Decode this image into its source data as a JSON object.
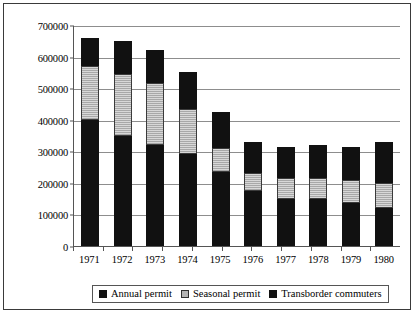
{
  "chart_data": {
    "type": "bar",
    "title": "",
    "xlabel": "",
    "ylabel": "",
    "stacked": true,
    "grid": true,
    "legend_position": "bottom",
    "ylim": [
      0,
      700000
    ],
    "yticks": [
      0,
      100000,
      200000,
      300000,
      400000,
      500000,
      600000,
      700000
    ],
    "ytick_labels": [
      "0",
      "100000",
      "200000",
      "300000",
      "400000",
      "500000",
      "600000",
      "700000"
    ],
    "categories": [
      "1971",
      "1972",
      "1973",
      "1974",
      "1975",
      "1976",
      "1977",
      "1978",
      "1979",
      "1980"
    ],
    "series": [
      {
        "name": "Annual permit",
        "color": "#111111",
        "values": [
          400000,
          350000,
          320000,
          290000,
          235000,
          175000,
          150000,
          150000,
          135000,
          120000
        ]
      },
      {
        "name": "Seasonal permit",
        "color": "#b4b4b4",
        "values": [
          170000,
          195000,
          195000,
          145000,
          75000,
          55000,
          65000,
          65000,
          75000,
          80000
        ]
      },
      {
        "name": "Transborder commuters",
        "color": "#111111",
        "values": [
          90000,
          105000,
          105000,
          115000,
          115000,
          100000,
          100000,
          105000,
          105000,
          130000
        ]
      }
    ],
    "totals": [
      660000,
      650000,
      620000,
      550000,
      425000,
      330000,
      315000,
      320000,
      315000,
      330000
    ]
  },
  "legend": {
    "items": [
      {
        "label": "Annual permit",
        "swatch": "swatch-annual"
      },
      {
        "label": "Seasonal permit",
        "swatch": "swatch-seasonal"
      },
      {
        "label": "Transborder commuters",
        "swatch": "swatch-transborder"
      }
    ]
  }
}
